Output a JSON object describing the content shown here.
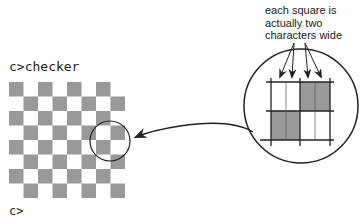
{
  "terminal": {
    "command_line": "c>checker",
    "next_prompt": "c>"
  },
  "annotation": {
    "caption_lines": [
      "each square is",
      "actually two",
      "characters wide"
    ]
  },
  "checkerboard": {
    "rows": 8,
    "cols": 8,
    "square_size_px": 14.5,
    "dark_color": "#999999",
    "light_color": "#ffffff",
    "first_row_starts_dark": true
  },
  "magnified_view": {
    "grid": "2x2 squares, each split into 2 character cells",
    "dark_cells": [
      "top-right",
      "bottom-left"
    ],
    "dark_color": "#999999"
  },
  "colors": {
    "ink": "#222222",
    "square_gray": "#999999"
  }
}
